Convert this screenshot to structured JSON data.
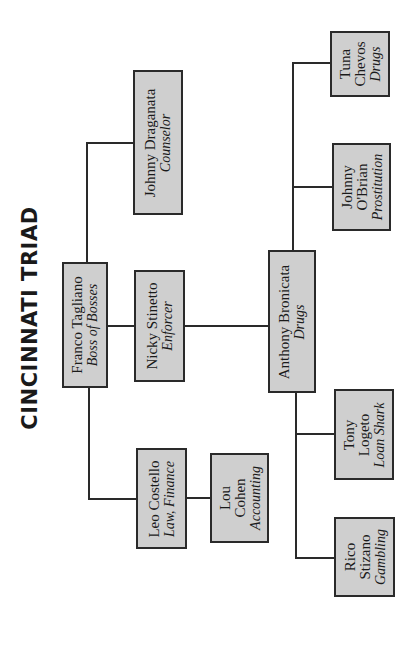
{
  "title": "CINCINNATI TRIAD",
  "nodes": {
    "franco": {
      "name": "Franco Tagliano",
      "role": "Boss of Bosses"
    },
    "draganata": {
      "name": "Johnny Draganata",
      "role": "Counselor"
    },
    "nicky": {
      "name": "Nicky Stinetto",
      "role": "Enforcer"
    },
    "leo": {
      "name": "Leo Costello",
      "role": "Law, Finance"
    },
    "lou": {
      "name_line1": "Lou",
      "name_line2": "Cohen",
      "role": "Accounting"
    },
    "anthony": {
      "name": "Anthony Bronicata",
      "role": "Drugs"
    },
    "tuna": {
      "name_line1": "Tuna",
      "name_line2": "Chevos",
      "role": "Drugs"
    },
    "obrian": {
      "name_line1": "Johnny",
      "name_line2": "O'Brian",
      "role": "Prostitution"
    },
    "tony": {
      "name_line1": "Tony",
      "name_line2": "Logeto",
      "role": "Loan Shark"
    },
    "rico": {
      "name_line1": "Rico",
      "name_line2": "Stizano",
      "role": "Gambling"
    }
  },
  "colors": {
    "box_fill": "#cfcfcf",
    "line": "#2a2a2a",
    "background": "#ffffff"
  }
}
